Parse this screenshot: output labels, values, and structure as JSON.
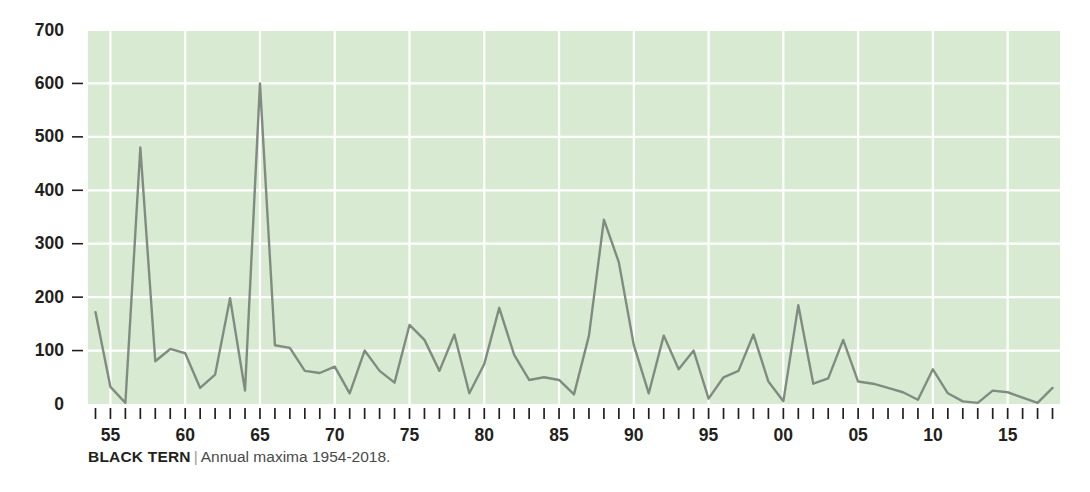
{
  "caption": {
    "title": "BLACK TERN",
    "separator": "|",
    "subtitle": "Annual maxima 1954-2018."
  },
  "chart_data": {
    "type": "line",
    "title": "BLACK TERN",
    "subtitle": "Annual maxima 1954-2018.",
    "xlabel": "",
    "ylabel": "",
    "xlim": [
      1953.5,
      2018.5
    ],
    "ylim": [
      0,
      700
    ],
    "grid": true,
    "legend": null,
    "plot_bgcolor": "#d9ead3",
    "line_color": "#808c80",
    "gridline_color": "#ffffff",
    "y_ticks": [
      0,
      100,
      200,
      300,
      400,
      500,
      600,
      700
    ],
    "y_tick_labels": [
      "0",
      "100",
      "200",
      "300",
      "400",
      "500",
      "600",
      "700"
    ],
    "x_tick_years": [
      1954,
      1955,
      1956,
      1957,
      1958,
      1959,
      1960,
      1961,
      1962,
      1963,
      1964,
      1965,
      1966,
      1967,
      1968,
      1969,
      1970,
      1971,
      1972,
      1973,
      1974,
      1975,
      1976,
      1977,
      1978,
      1979,
      1980,
      1981,
      1982,
      1983,
      1984,
      1985,
      1986,
      1987,
      1988,
      1989,
      1990,
      1991,
      1992,
      1993,
      1994,
      1995,
      1996,
      1997,
      1998,
      1999,
      2000,
      2001,
      2002,
      2003,
      2004,
      2005,
      2006,
      2007,
      2008,
      2009,
      2010,
      2011,
      2012,
      2013,
      2014,
      2015,
      2016,
      2017,
      2018
    ],
    "x_labeled_years": [
      1955,
      1960,
      1965,
      1970,
      1975,
      1980,
      1985,
      1990,
      1995,
      2000,
      2005,
      2010,
      2015
    ],
    "x_labels": [
      "55",
      "60",
      "65",
      "70",
      "75",
      "80",
      "85",
      "90",
      "95",
      "00",
      "05",
      "10",
      "15"
    ],
    "x": [
      1954,
      1955,
      1956,
      1957,
      1958,
      1959,
      1960,
      1961,
      1962,
      1963,
      1964,
      1965,
      1966,
      1967,
      1968,
      1969,
      1970,
      1971,
      1972,
      1973,
      1974,
      1975,
      1976,
      1977,
      1978,
      1979,
      1980,
      1981,
      1982,
      1983,
      1984,
      1985,
      1986,
      1987,
      1988,
      1989,
      1990,
      1991,
      1992,
      1993,
      1994,
      1995,
      1996,
      1997,
      1998,
      1999,
      2000,
      2001,
      2002,
      2003,
      2004,
      2005,
      2006,
      2007,
      2008,
      2009,
      2010,
      2011,
      2012,
      2013,
      2014,
      2015,
      2016,
      2017,
      2018
    ],
    "values": [
      172,
      32,
      2,
      480,
      80,
      103,
      95,
      30,
      55,
      198,
      25,
      600,
      110,
      105,
      62,
      58,
      70,
      20,
      100,
      62,
      40,
      148,
      120,
      62,
      130,
      20,
      75,
      180,
      92,
      45,
      50,
      45,
      18,
      128,
      345,
      265,
      110,
      20,
      128,
      65,
      100,
      10,
      50,
      62,
      130,
      42,
      5,
      185,
      38,
      48,
      120,
      42,
      38,
      30,
      22,
      8,
      65,
      20,
      5,
      2,
      25,
      22,
      12,
      2,
      30
    ]
  }
}
